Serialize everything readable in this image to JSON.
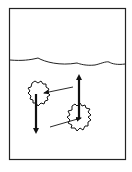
{
  "diagram": {
    "colors": {
      "ink": "#111111",
      "background": "#ffffff"
    },
    "frame": {
      "x": 9,
      "y": 8,
      "width": 116,
      "height": 151
    },
    "water_surface": {
      "y": 60
    },
    "objects": [
      {
        "name": "sinking-object",
        "cx": 38,
        "cy": 92,
        "r": 10,
        "force": "down"
      },
      {
        "name": "floating-object",
        "cx": 79,
        "cy": 117,
        "r": 12,
        "force": "up"
      }
    ]
  }
}
